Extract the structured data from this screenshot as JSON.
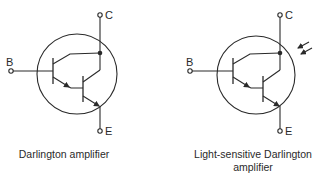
{
  "diagrams": [
    {
      "id": "darlington",
      "caption": "Darlington amplifier",
      "terminals": {
        "base": "B",
        "collector": "C",
        "emitter": "E"
      },
      "light_sensitive": false
    },
    {
      "id": "light-darlington",
      "caption_line1": "Light-sensitive Darlington",
      "caption_line2": "amplifier",
      "terminals": {
        "base": "B",
        "collector": "C",
        "emitter": "E"
      },
      "light_sensitive": true
    }
  ],
  "colors": {
    "line": "#2a2a2a",
    "background": "#ffffff"
  }
}
